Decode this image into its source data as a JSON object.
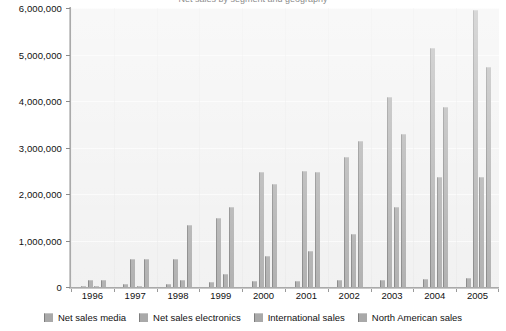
{
  "chart_data": {
    "type": "bar",
    "title": "Net sales by segment and geography",
    "xlabel": "",
    "ylabel": "",
    "ylim": [
      0,
      6000000
    ],
    "yticks": [
      0,
      1000000,
      2000000,
      3000000,
      4000000,
      5000000,
      6000000
    ],
    "ytick_labels": [
      "0",
      "1,000,000",
      "2,000,000",
      "3,000,000",
      "4,000,000",
      "5,000,000",
      "6,000,000"
    ],
    "grid": true,
    "legend_position": "bottom",
    "categories": [
      "1996",
      "1997",
      "1998",
      "1999",
      "2000",
      "2001",
      "2002",
      "2003",
      "2004",
      "2005"
    ],
    "series": [
      {
        "name": "Net sales media",
        "values": [
          30000,
          70000,
          70000,
          110000,
          120000,
          130000,
          150000,
          160000,
          170000,
          190000
        ]
      },
      {
        "name": "Net sales electronics",
        "values": [
          150000,
          610000,
          610000,
          1480000,
          2480000,
          2490000,
          2790000,
          4090000,
          5130000,
          5950000
        ]
      },
      {
        "name": "International sales",
        "values": [
          0,
          30000,
          150000,
          270000,
          660000,
          770000,
          1150000,
          1730000,
          2370000,
          2370000
        ]
      },
      {
        "name": "North American sales",
        "values": [
          150000,
          600000,
          1330000,
          1730000,
          2210000,
          2480000,
          3140000,
          3280000,
          3870000,
          4740000
        ]
      }
    ]
  },
  "legend": {
    "items": [
      {
        "label": "Net sales media"
      },
      {
        "label": "Net sales electronics"
      },
      {
        "label": "International sales"
      },
      {
        "label": "North American sales"
      }
    ]
  }
}
